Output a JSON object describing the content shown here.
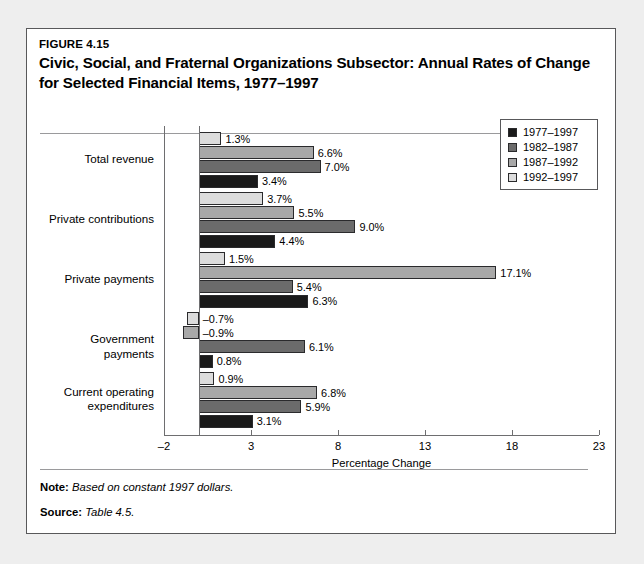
{
  "figure": {
    "number": "FIGURE 4.15",
    "title": "Civic, Social, and Fraternal Organizations Subsector: Annual Rates of Change for Selected Financial Items, 1977–1997"
  },
  "footer": {
    "note_key": "Note:",
    "note_value": "Based on constant 1997 dollars.",
    "source_key": "Source:",
    "source_value": "Table 4.5."
  },
  "colors": {
    "series_1977_1997": "#1a1a1a",
    "series_1982_1987": "#6b6b6b",
    "series_1987_1992": "#a8a8a8",
    "series_1992_1997": "#dcdcdc",
    "bar_border": "#2a2a2c",
    "axis": "#6e6e70",
    "card_border": "#58585a",
    "page_background": "#eeeeee"
  },
  "chart_data": {
    "type": "bar",
    "orientation": "horizontal",
    "title": "Civic, Social, and Fraternal Organizations Subsector: Annual Rates of Change for Selected Financial Items, 1977–1997",
    "xlabel": "Percentage Change",
    "ylabel": "",
    "xlim": [
      -2,
      23
    ],
    "xticks": [
      -2,
      3,
      8,
      13,
      18,
      23
    ],
    "xtick_labels": [
      "–2",
      "3",
      "8",
      "13",
      "18",
      "23"
    ],
    "grid": false,
    "legend_position": "top-right",
    "categories": [
      "Total revenue",
      "Private contributions",
      "Private payments",
      "Government payments",
      "Current operating\nexpenditures"
    ],
    "series": [
      {
        "name": "1977–1997",
        "color": "#1a1a1a",
        "values": [
          3.4,
          4.4,
          6.3,
          0.8,
          3.1
        ],
        "labels": [
          "3.4%",
          "4.4%",
          "6.3%",
          "0.8%",
          "3.1%"
        ]
      },
      {
        "name": "1982–1987",
        "color": "#6b6b6b",
        "values": [
          7.0,
          9.0,
          5.4,
          6.1,
          5.9
        ],
        "labels": [
          "7.0%",
          "9.0%",
          "5.4%",
          "6.1%",
          "5.9%"
        ]
      },
      {
        "name": "1987–1992",
        "color": "#a8a8a8",
        "values": [
          6.6,
          5.5,
          17.1,
          -0.9,
          6.8
        ],
        "labels": [
          "6.6%",
          "5.5%",
          "17.1%",
          "–0.9%",
          "6.8%"
        ]
      },
      {
        "name": "1992–1997",
        "color": "#dcdcdc",
        "values": [
          1.3,
          3.7,
          1.5,
          -0.7,
          0.9
        ],
        "labels": [
          "1.3%",
          "3.7%",
          "1.5%",
          "–0.7%",
          "0.9%"
        ]
      }
    ]
  }
}
